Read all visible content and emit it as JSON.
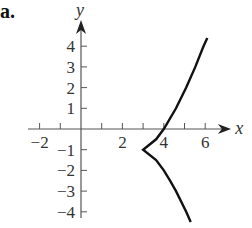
{
  "panel_label": "a.",
  "chart_data": {
    "type": "line",
    "title": "",
    "xlabel": "x",
    "ylabel": "y",
    "xlim": [
      -2.5,
      7.5
    ],
    "ylim": [
      -4.7,
      5
    ],
    "grid": false,
    "x_tick_labels": [
      "-2",
      "2",
      "4",
      "6"
    ],
    "x_ticks": [
      -2,
      -1,
      1,
      2,
      3,
      4,
      5,
      6
    ],
    "y_tick_labels": [
      "4",
      "3",
      "2",
      "1",
      "-1",
      "-2",
      "-3",
      "-4"
    ],
    "y_ticks": [
      4,
      3,
      2,
      1,
      -1,
      -2,
      -3,
      -4
    ],
    "series": [
      {
        "name": "curve",
        "description": "cusp at (3, -1); x = 3 + (y+1)^(2/3)",
        "points": [
          [
            5.3,
            -4.5
          ],
          [
            5.08,
            -4
          ],
          [
            4.59,
            -3
          ],
          [
            4.31,
            -2.5
          ],
          [
            4.0,
            -2
          ],
          [
            3.63,
            -1.5
          ],
          [
            3.0,
            -1
          ],
          [
            3.63,
            -0.5
          ],
          [
            4.0,
            0
          ],
          [
            4.59,
            1
          ],
          [
            5.08,
            2
          ],
          [
            5.52,
            3
          ],
          [
            5.92,
            4
          ],
          [
            6.1,
            4.4
          ]
        ]
      }
    ],
    "cusp": [
      3,
      -1
    ]
  }
}
